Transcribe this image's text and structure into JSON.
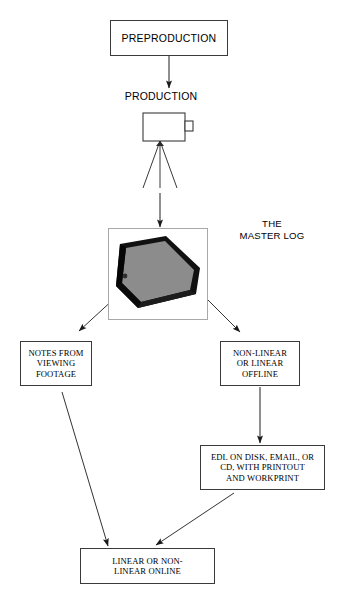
{
  "diagram": {
    "nodes": {
      "preproduction": "PREPRODUCTION",
      "production_label": "PRODUCTION",
      "master_log_label": "THE\nMASTER LOG",
      "notes": "NOTES FROM\nVIEWING\nFOOTAGE",
      "offline": "NON-LINEAR\nOR LINEAR\nOFFLINE",
      "edl": "EDL ON DISK, EMAIL, OR\nCD, WITH PRINTOUT\nAND WORKPRINT",
      "online": "LINEAR  OR  NON-\nLINEAR ONLINE"
    },
    "icons": {
      "camera": "video-camera-on-tripod-icon",
      "binder": "three-ring-binder-icon"
    },
    "colors": {
      "stroke": "#3a3a3a",
      "frame": "#a8a8a8",
      "arrow": "#222222",
      "binder_cover": "#8c8c8c",
      "binder_edge": "#111111",
      "background": "#ffffff"
    },
    "edges": [
      {
        "from": "preproduction",
        "to": "production_label",
        "style": "straight-down"
      },
      {
        "from": "camera",
        "to": "master_log",
        "style": "straight-down"
      },
      {
        "from": "master_log",
        "to": "notes",
        "style": "diagonal-left"
      },
      {
        "from": "master_log",
        "to": "offline",
        "style": "diagonal-right"
      },
      {
        "from": "notes",
        "to": "online",
        "style": "diagonal-long-left"
      },
      {
        "from": "offline",
        "to": "edl",
        "style": "straight-down"
      },
      {
        "from": "edl",
        "to": "online",
        "style": "diagonal-up-left"
      }
    ]
  }
}
